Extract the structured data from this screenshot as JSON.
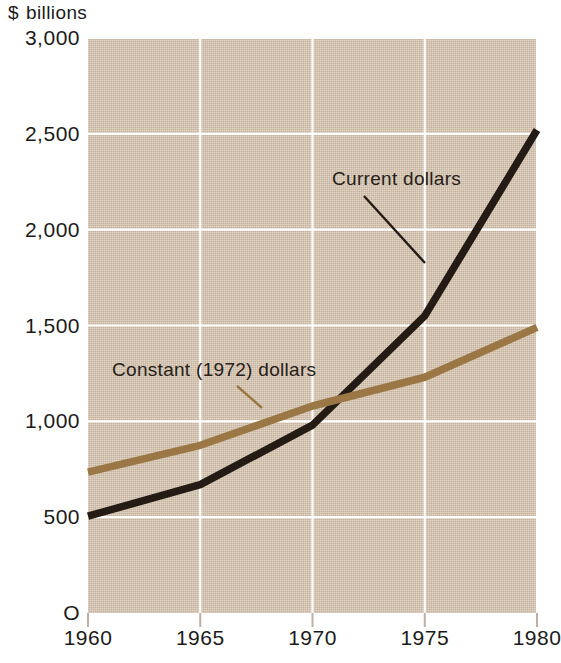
{
  "chart_data": {
    "type": "line",
    "xlabel": "",
    "ylabel": "$ billions",
    "xlim": [
      1960,
      1980
    ],
    "ylim": [
      0,
      3000
    ],
    "grid": true,
    "legend_position": "inline-annotations",
    "x": [
      1960,
      1965,
      1970,
      1975,
      1980
    ],
    "xticklabels": [
      "1960",
      "1965",
      "1970",
      "1975",
      "1980"
    ],
    "yticks": [
      0,
      500,
      1000,
      1500,
      2000,
      2500,
      3000
    ],
    "yticklabels": [
      "O",
      "500",
      "1,000",
      "1,500",
      "2,000",
      "2,500",
      "3,000"
    ],
    "series": [
      {
        "name": "Current dollars",
        "color": "#241c14",
        "values": [
          505,
          670,
          980,
          1550,
          2520
        ]
      },
      {
        "name": "Constant (1972) dollars",
        "color": "#9a7744",
        "values": [
          735,
          875,
          1080,
          1230,
          1490
        ]
      }
    ],
    "annotations": [
      {
        "text": "Current dollars",
        "series": "Current dollars"
      },
      {
        "text": "Constant (1972) dollars",
        "series": "Constant (1972) dollars"
      }
    ],
    "colors": {
      "plot_background": "#d3c1ab",
      "gridline": "#ffffff",
      "current_dollars": "#241c14",
      "constant_dollars": "#9a7744",
      "text": "#1b1b1b"
    }
  },
  "axis": {
    "title_dollar": "$",
    "title_unit": "billions"
  }
}
